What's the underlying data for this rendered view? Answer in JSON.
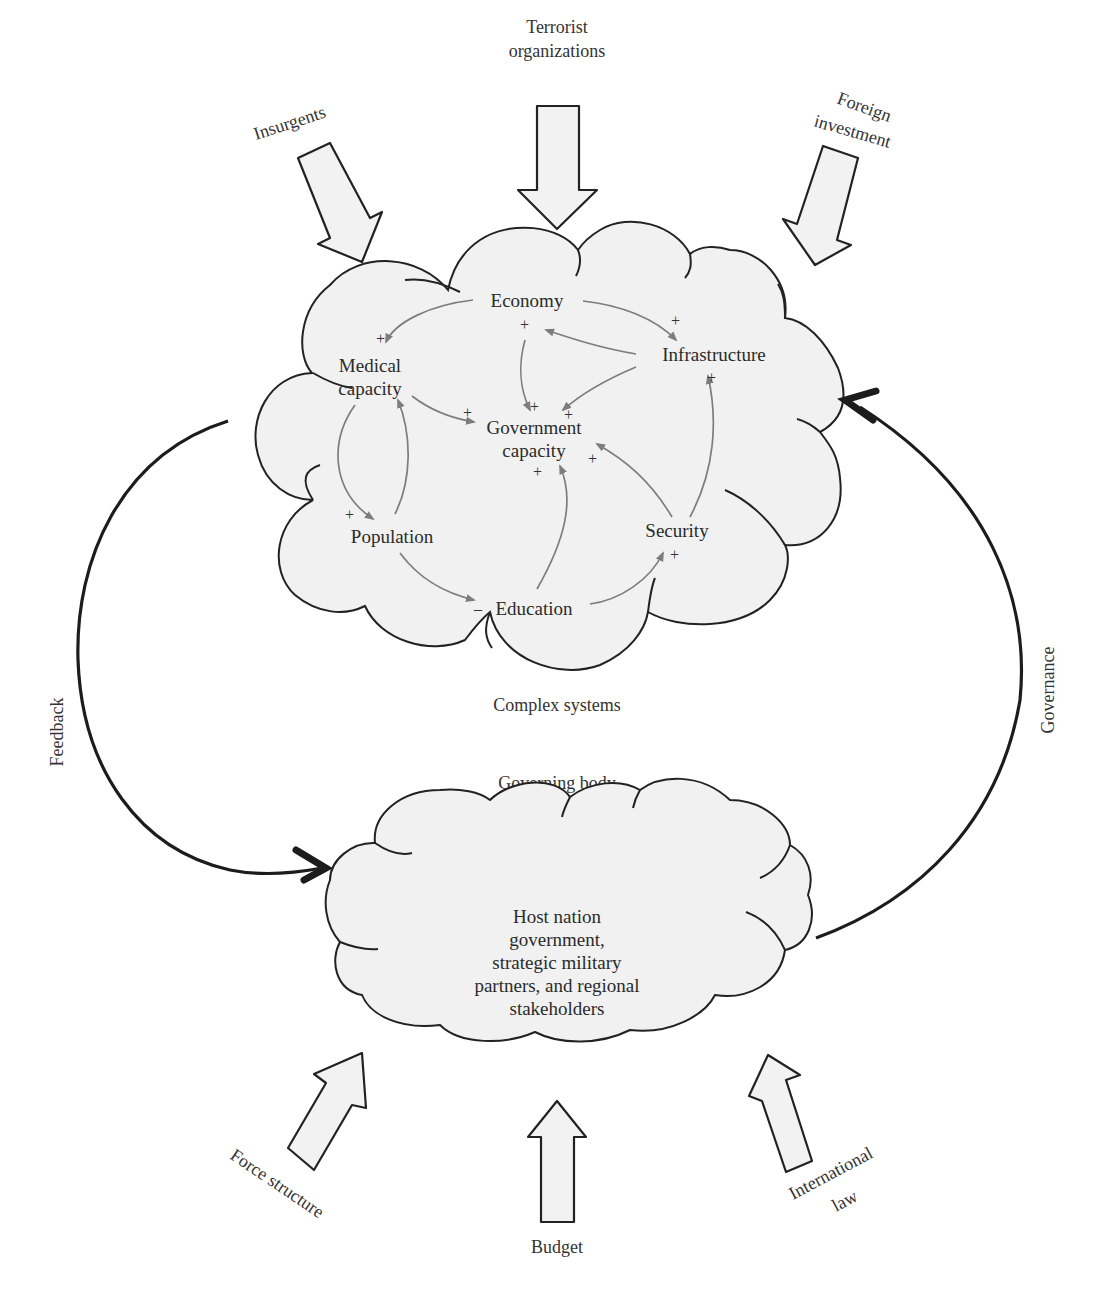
{
  "diagram": {
    "colors": {
      "cloud_fill": "#f1f1f1",
      "outline": "#222222",
      "causal_link": "#7d7d7d",
      "text": "#2b2b2b"
    },
    "external_inputs_top": [
      {
        "id": "insurgents",
        "label": "Insurgents",
        "direction": "into complex systems"
      },
      {
        "id": "terrorist_organizations",
        "label_lines": [
          "Terrorist",
          "organizations"
        ],
        "direction": "into complex systems"
      },
      {
        "id": "foreign_investment",
        "label_lines": [
          "Foreign",
          "investment"
        ],
        "direction": "into complex systems"
      }
    ],
    "complex_systems": {
      "caption": "Complex systems",
      "nodes": {
        "economy": "Economy",
        "medical_capacity": [
          "Medical",
          "capacity"
        ],
        "infrastructure": "Infrastructure",
        "government_capacity": [
          "Government",
          "capacity"
        ],
        "population": "Population",
        "security": "Security",
        "education": "Education"
      },
      "links": [
        {
          "from": "Economy",
          "to": "Medical capacity",
          "polarity": "+"
        },
        {
          "from": "Economy",
          "to": "Infrastructure",
          "polarity": "+"
        },
        {
          "from": "Economy",
          "to": "Government capacity",
          "polarity": "+"
        },
        {
          "from": "Infrastructure",
          "to": "Economy",
          "polarity": "+"
        },
        {
          "from": "Infrastructure",
          "to": "Government capacity",
          "polarity": "+"
        },
        {
          "from": "Medical capacity",
          "to": "Government capacity",
          "polarity": "+"
        },
        {
          "from": "Medical capacity",
          "to": "Population",
          "polarity": "+"
        },
        {
          "from": "Population",
          "to": "Medical capacity",
          "polarity": ""
        },
        {
          "from": "Population",
          "to": "Education",
          "polarity": "–"
        },
        {
          "from": "Education",
          "to": "Government capacity",
          "polarity": "+"
        },
        {
          "from": "Education",
          "to": "Security",
          "polarity": "+"
        },
        {
          "from": "Security",
          "to": "Government capacity",
          "polarity": "+"
        },
        {
          "from": "Security",
          "to": "Infrastructure",
          "polarity": "+"
        }
      ],
      "signs": {
        "plus": "+",
        "minus": "–"
      }
    },
    "loops": {
      "feedback": "Feedback",
      "governance": "Governance"
    },
    "governing_body": {
      "caption": "Governing body",
      "text_lines": [
        "Host nation",
        "government,",
        "strategic military",
        "partners, and regional",
        "stakeholders"
      ]
    },
    "external_inputs_bottom": [
      {
        "id": "force_structure",
        "label": "Force structure",
        "direction": "into governing body"
      },
      {
        "id": "budget",
        "label": "Budget",
        "direction": "into governing body"
      },
      {
        "id": "international_law",
        "label_lines": [
          "International",
          "law"
        ],
        "direction": "into governing body"
      }
    ]
  }
}
